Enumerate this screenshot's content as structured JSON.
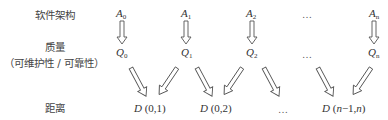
{
  "row_labels": {
    "architecture": "软件架构",
    "quality": "质量",
    "quality_sub": "（可维护性 / 可靠性）",
    "distance": "距离"
  },
  "architectures": [
    {
      "symbol": "A",
      "sub": "0"
    },
    {
      "symbol": "A",
      "sub": "1"
    },
    {
      "symbol": "A",
      "sub": "2"
    },
    {
      "symbol": "A",
      "sub": "n"
    }
  ],
  "qualities": [
    {
      "symbol": "Q",
      "sub": "0"
    },
    {
      "symbol": "Q",
      "sub": "1"
    },
    {
      "symbol": "Q",
      "sub": "2"
    },
    {
      "symbol": "Q",
      "sub": "n"
    }
  ],
  "distances": [
    {
      "symbol": "D",
      "args": "(0,1)"
    },
    {
      "symbol": "D",
      "args": "(0,2)"
    },
    {
      "symbol": "D",
      "args_prefix": "(",
      "args_italic1": "n",
      "args_mid": "−1,",
      "args_italic2": "n",
      "args_suffix": ")"
    }
  ],
  "ellipsis": "…",
  "colors": {
    "text": "#333333",
    "arrow_stroke": "#555555",
    "arrow_fill": "#ffffff"
  }
}
